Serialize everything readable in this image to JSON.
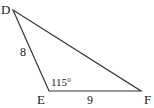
{
  "diagram": {
    "type": "triangle",
    "colors": {
      "stroke": "#333333",
      "text": "#222222",
      "background": "#ffffff"
    },
    "vertices": [
      {
        "name": "D",
        "x": 13,
        "y": 10
      },
      {
        "name": "E",
        "x": 49,
        "y": 91
      },
      {
        "name": "F",
        "x": 141,
        "y": 91
      }
    ],
    "labels": {
      "vertex_d": "D",
      "vertex_e": "E",
      "vertex_f": "F",
      "side_de": "8",
      "side_ef": "9",
      "angle_e": "115°"
    }
  }
}
